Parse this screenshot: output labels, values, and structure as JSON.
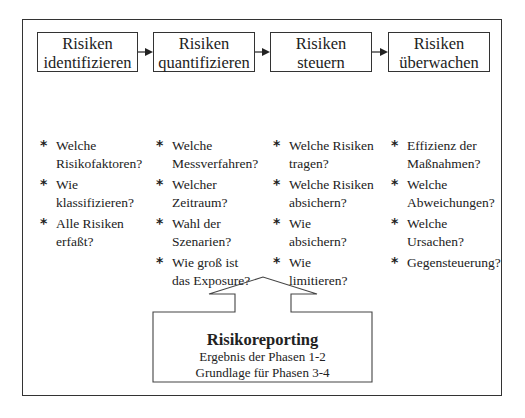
{
  "phases": [
    {
      "line1": "Risiken",
      "line2": "identifizieren"
    },
    {
      "line1": "Risiken",
      "line2": "quantifizieren"
    },
    {
      "line1": "Risiken",
      "line2": "steuern"
    },
    {
      "line1": "Risiken",
      "line2": "überwachen"
    }
  ],
  "columns": [
    {
      "questions": [
        {
          "l1": "Welche",
          "l2": "Risikofaktoren?"
        },
        {
          "l1": "Wie",
          "l2": "klassifizieren?"
        },
        {
          "l1": "Alle Risiken",
          "l2": "erfaßt?"
        }
      ]
    },
    {
      "questions": [
        {
          "l1": "Welche",
          "l2": "Messverfahren?"
        },
        {
          "l1": "Welcher",
          "l2": "Zeitraum?"
        },
        {
          "l1": "Wahl der",
          "l2": "Szenarien?"
        },
        {
          "l1": "Wie groß ist",
          "l2": "das Exposure?"
        }
      ]
    },
    {
      "questions": [
        {
          "l1": "Welche Risiken",
          "l2": "tragen?"
        },
        {
          "l1": "Welche Risiken",
          "l2": "absichern?"
        },
        {
          "l1": "Wie",
          "l2": "absichern?"
        },
        {
          "l1": "Wie",
          "l2": "limitieren?"
        }
      ]
    },
    {
      "questions": [
        {
          "l1": "Effizienz der",
          "l2": "Maßnahmen?"
        },
        {
          "l1": "Welche",
          "l2": "Abweichungen?"
        },
        {
          "l1": "Welche",
          "l2": "Ursachen?"
        },
        {
          "l1": "Gegensteuerung?",
          "l2": ""
        }
      ]
    }
  ],
  "bullet": "*",
  "report": {
    "title": "Risikoreporting",
    "line1": "Ergebnis der Phasen 1-2",
    "line2": "Grundlage für Phasen 3-4"
  }
}
